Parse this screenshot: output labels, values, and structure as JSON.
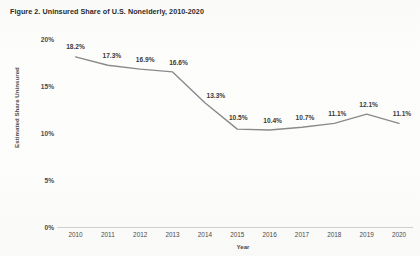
{
  "figure": {
    "title": "Figure 2. Uninsured Share of U.S. Nonelderly, 2010-2020"
  },
  "axis_titles": {
    "x": "Year",
    "y": "Estimated Share Uninsured"
  },
  "colors": {
    "line": "#8a8a8a",
    "text": "#4a4a4a",
    "title": "#2b2b2b",
    "axis": "#cfcfcf",
    "background": "#fdfdfc"
  },
  "chart_data": {
    "type": "line",
    "title": "Figure 2. Uninsured Share of U.S. Nonelderly, 2010-2020",
    "xlabel": "Year",
    "ylabel": "Estimated Share Uninsured",
    "categories": [
      "2010",
      "2011",
      "2012",
      "2013",
      "2014",
      "2015",
      "2016",
      "2017",
      "2018",
      "2019",
      "2020"
    ],
    "values": [
      18.2,
      17.3,
      16.9,
      16.6,
      13.3,
      10.5,
      10.4,
      10.7,
      11.1,
      12.1,
      11.1
    ],
    "data_labels": [
      "18.2%",
      "17.3%",
      "16.9%",
      "16.6%",
      "13.3%",
      "10.5%",
      "10.4%",
      "10.7%",
      "11.1%",
      "12.1%",
      "11.1%"
    ],
    "ylim": [
      0,
      20
    ],
    "yticks": [
      0,
      5,
      10,
      15,
      20
    ],
    "ytick_labels": [
      "0%",
      "5%",
      "10%",
      "15%",
      "20%"
    ],
    "grid": false,
    "legend": false,
    "series": [
      {
        "name": "Estimated Share Uninsured",
        "values": [
          18.2,
          17.3,
          16.9,
          16.6,
          13.3,
          10.5,
          10.4,
          10.7,
          11.1,
          12.1,
          11.1
        ]
      }
    ]
  }
}
